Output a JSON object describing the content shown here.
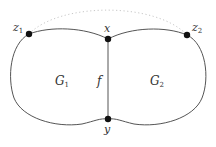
{
  "diagram": {
    "type": "graph",
    "edge_color": "#555555",
    "node_color": "#111111",
    "nodes": [
      {
        "id": "z1",
        "label": "z",
        "sub": "1",
        "x": 29,
        "y": 34
      },
      {
        "id": "x",
        "label": "x",
        "sub": "",
        "x": 108,
        "y": 39
      },
      {
        "id": "z2",
        "label": "z",
        "sub": "2",
        "x": 187,
        "y": 35
      },
      {
        "id": "y",
        "label": "y",
        "sub": "",
        "x": 108,
        "y": 119
      }
    ],
    "regions": [
      {
        "id": "G1",
        "label": "G",
        "sub": "1"
      },
      {
        "id": "G2",
        "label": "G",
        "sub": "2"
      }
    ],
    "edge_label": "f",
    "dotted_arc": {
      "from": "z1",
      "to": "z2"
    }
  }
}
